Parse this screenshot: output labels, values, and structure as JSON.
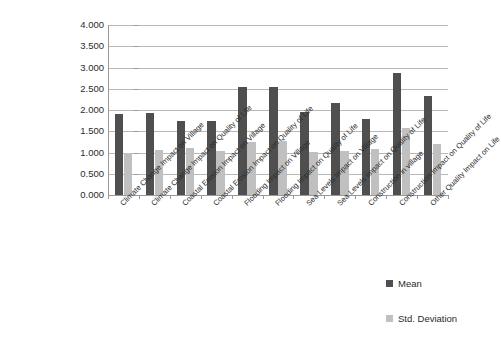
{
  "chart_data": {
    "type": "bar",
    "title": "",
    "xlabel": "",
    "ylabel": "",
    "ylim": [
      0,
      4
    ],
    "ytick_labels": [
      "4.000",
      "3.500",
      "3.000",
      "2.500",
      "2.000",
      "1.500",
      "1.000",
      "0.500",
      "0.000"
    ],
    "ytick_values": [
      4.0,
      3.5,
      3.0,
      2.5,
      2.0,
      1.5,
      1.0,
      0.5,
      0.0
    ],
    "grid": true,
    "legend_position": "right",
    "categories": [
      "Climate Change Impact on Village",
      "Climate Change Impact on Quality of Life",
      "Coastal Erosion Impact on Village",
      "Coastal Erosion Impact on Quality of Life",
      "Flooding Impact on Village",
      "Flooding Impact on Quality of Life",
      "Sea Levels Impact on Village",
      "Sea Levels Impact on Quality of Life",
      "Construction in village",
      "Construction Impact on Quality of Life",
      "Other Quality Impact on Life"
    ],
    "series": [
      {
        "name": "Mean",
        "color": "#4f4f4f",
        "values": [
          1.91,
          1.93,
          1.75,
          1.75,
          2.54,
          2.54,
          1.95,
          2.16,
          1.79,
          2.87,
          2.33
        ]
      },
      {
        "name": "Std. Deviation",
        "color": "#c0c0c0",
        "values": [
          0.99,
          1.05,
          1.1,
          1.03,
          1.24,
          1.27,
          1.02,
          1.03,
          1.08,
          1.57,
          1.2
        ]
      }
    ]
  },
  "legend": {
    "items": [
      {
        "label": "Mean",
        "color": "#4f4f4f"
      },
      {
        "label": "Std. Deviation",
        "color": "#c0c0c0"
      }
    ]
  }
}
